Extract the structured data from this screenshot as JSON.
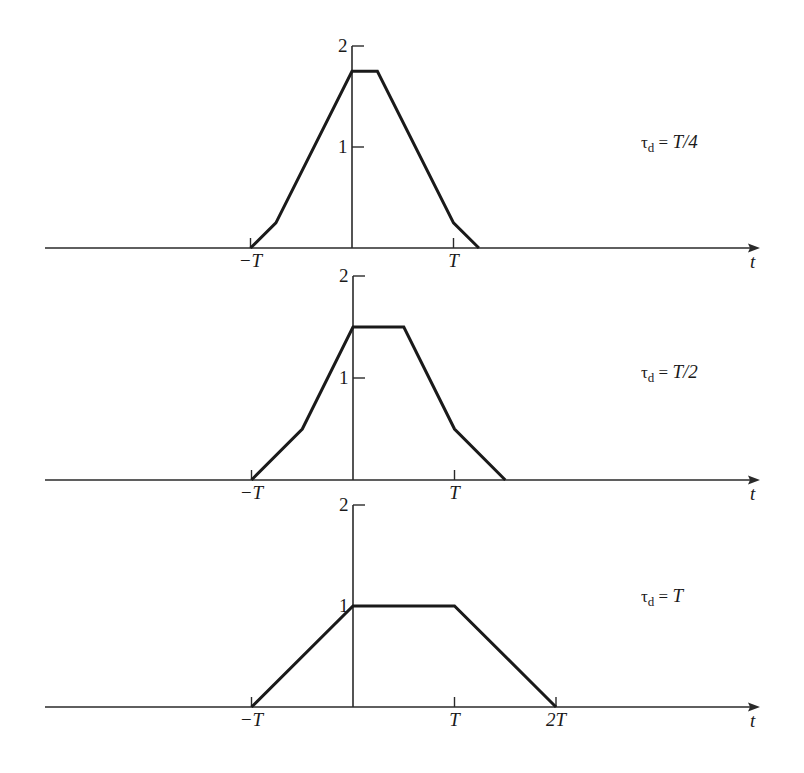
{
  "chart_data": [
    {
      "type": "line",
      "title": "",
      "annotation": "τd = T/4",
      "annotation_parts": {
        "symbol": "τ",
        "sub": "d",
        "eq": " = ",
        "value": "T/4"
      },
      "xlabel": "t",
      "ylabel": "",
      "x_unit": "T",
      "x_ticks": [
        {
          "value": -1,
          "label": "−T"
        },
        {
          "value": 1,
          "label": "T"
        }
      ],
      "y_ticks": [
        {
          "value": 1,
          "label": "1"
        },
        {
          "value": 2,
          "label": "2"
        }
      ],
      "ylim": [
        0,
        2
      ],
      "grid": false,
      "x": [
        -1,
        -0.75,
        0,
        0.25,
        1,
        1.25
      ],
      "values": [
        0,
        0.25,
        1.75,
        1.75,
        0.25,
        0
      ]
    },
    {
      "type": "line",
      "title": "",
      "annotation": "τd = T/2",
      "annotation_parts": {
        "symbol": "τ",
        "sub": "d",
        "eq": " = ",
        "value": "T/2"
      },
      "xlabel": "t",
      "ylabel": "",
      "x_unit": "T",
      "x_ticks": [
        {
          "value": -1,
          "label": "−T"
        },
        {
          "value": 1,
          "label": "T"
        }
      ],
      "y_ticks": [
        {
          "value": 1,
          "label": "1"
        },
        {
          "value": 2,
          "label": "2"
        }
      ],
      "ylim": [
        0,
        2
      ],
      "grid": false,
      "x": [
        -1,
        -0.5,
        0,
        0.5,
        1,
        1.5
      ],
      "values": [
        0,
        0.5,
        1.5,
        1.5,
        0.5,
        0
      ]
    },
    {
      "type": "line",
      "title": "",
      "annotation": "τd = T",
      "annotation_parts": {
        "symbol": "τ",
        "sub": "d",
        "eq": " = ",
        "value": "T"
      },
      "xlabel": "t",
      "ylabel": "",
      "x_unit": "T",
      "x_ticks": [
        {
          "value": -1,
          "label": "−T"
        },
        {
          "value": 1,
          "label": "T"
        },
        {
          "value": 2,
          "label": "2T"
        }
      ],
      "y_ticks": [
        {
          "value": 1,
          "label": "1"
        },
        {
          "value": 2,
          "label": "2"
        }
      ],
      "ylim": [
        0,
        2
      ],
      "grid": false,
      "x": [
        -1,
        0,
        1,
        2
      ],
      "values": [
        0,
        1,
        1,
        0
      ]
    }
  ]
}
